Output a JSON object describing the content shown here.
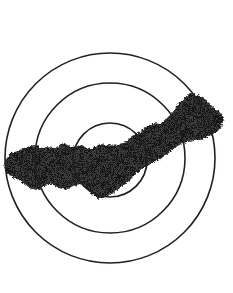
{
  "figure": {
    "type": "diagram",
    "width": 233,
    "height": 293,
    "background_color": "#ffffff"
  },
  "colors": {
    "background": "#ffffff",
    "stroke": "#231f20",
    "region_fill": "#3a3a3a",
    "region_fill_dark": "#2b2b2b",
    "halftone_dot": "#151515"
  },
  "chart_data": {
    "type": "diagram",
    "title": "",
    "grid": false,
    "legend": null,
    "center": {
      "x": 110,
      "y": 158
    },
    "circles": [
      {
        "name": "outer-circle",
        "cx": 110,
        "cy": 158,
        "r": 105,
        "stroke_width": 1.6
      },
      {
        "name": "middle-circle",
        "cx": 110,
        "cy": 158,
        "r": 75,
        "stroke_width": 1.6
      },
      {
        "name": "inner-circle",
        "cx": 110,
        "cy": 160,
        "r": 37,
        "stroke_width": 1.7
      }
    ],
    "shaded_region": {
      "name": "irregular-band",
      "description": "Dark halftone band crossing from lower-left to upper-right, extending beyond the outer circle on both ends",
      "fill": "#3a3a3a",
      "texture": "halftone-dither",
      "extent": {
        "x_min": 4,
        "x_max": 224,
        "y_min": 93,
        "y_max": 199
      },
      "outline_points": [
        [
          6,
          172
        ],
        [
          4,
          162
        ],
        [
          11,
          153
        ],
        [
          22,
          150
        ],
        [
          31,
          146
        ],
        [
          40,
          150
        ],
        [
          46,
          147
        ],
        [
          55,
          148
        ],
        [
          63,
          143
        ],
        [
          72,
          147
        ],
        [
          82,
          145
        ],
        [
          92,
          150
        ],
        [
          100,
          146
        ],
        [
          108,
          150
        ],
        [
          114,
          144
        ],
        [
          121,
          146
        ],
        [
          129,
          139
        ],
        [
          138,
          133
        ],
        [
          146,
          127
        ],
        [
          153,
          123
        ],
        [
          160,
          124
        ],
        [
          166,
          119
        ],
        [
          172,
          113
        ],
        [
          178,
          106
        ],
        [
          185,
          98
        ],
        [
          192,
          93
        ],
        [
          199,
          97
        ],
        [
          205,
          105
        ],
        [
          211,
          110
        ],
        [
          218,
          110
        ],
        [
          224,
          118
        ],
        [
          221,
          128
        ],
        [
          214,
          133
        ],
        [
          207,
          137
        ],
        [
          199,
          140
        ],
        [
          191,
          141
        ],
        [
          183,
          143
        ],
        [
          176,
          147
        ],
        [
          170,
          152
        ],
        [
          163,
          157
        ],
        [
          156,
          161
        ],
        [
          149,
          165
        ],
        [
          142,
          169
        ],
        [
          135,
          175
        ],
        [
          128,
          182
        ],
        [
          120,
          188
        ],
        [
          113,
          193
        ],
        [
          106,
          197
        ],
        [
          99,
          199
        ],
        [
          92,
          194
        ],
        [
          86,
          188
        ],
        [
          80,
          184
        ],
        [
          73,
          186
        ],
        [
          66,
          190
        ],
        [
          59,
          188
        ],
        [
          52,
          184
        ],
        [
          45,
          186
        ],
        [
          38,
          190
        ],
        [
          31,
          189
        ],
        [
          25,
          184
        ],
        [
          19,
          180
        ],
        [
          12,
          177
        ]
      ]
    }
  },
  "elements": {
    "outer_circle_label": "outer circle",
    "middle_circle_label": "middle circle",
    "inner_circle_label": "inner circle",
    "region_label": "shaded region"
  }
}
